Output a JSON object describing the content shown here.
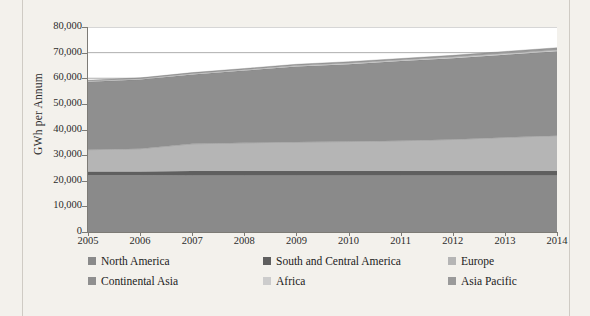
{
  "figure": {
    "background_color": "#f3f1ec",
    "plot_background_color": "#ffffff"
  },
  "chart_data": {
    "type": "area",
    "stacked": true,
    "title": "",
    "xlabel": "",
    "ylabel": "GWh per Annum",
    "x": [
      2005,
      2006,
      2007,
      2008,
      2009,
      2010,
      2011,
      2012,
      2013,
      2014
    ],
    "categories": [
      "2005",
      "2006",
      "2007",
      "2008",
      "2009",
      "2010",
      "2011",
      "2012",
      "2013",
      "2014"
    ],
    "ylim": [
      0,
      80000
    ],
    "yticks": [
      0,
      10000,
      20000,
      30000,
      40000,
      50000,
      60000,
      70000,
      80000
    ],
    "ytick_labels": [
      "0",
      "10,000",
      "20,000",
      "30,000",
      "40,000",
      "50,000",
      "60,000",
      "70,000",
      "80,000"
    ],
    "xlim": [
      2005,
      2014
    ],
    "grid": true,
    "gridlines_visible_at": [
      70000,
      80000
    ],
    "legend_position": "bottom",
    "series": [
      {
        "name": "North America",
        "color": "#8a8a8a",
        "values": [
          22100,
          22100,
          22200,
          22200,
          22200,
          22200,
          22200,
          22200,
          22200,
          22200
        ]
      },
      {
        "name": "South and Central America",
        "color": "#5f5f5f",
        "values": [
          1500,
          1500,
          1600,
          1600,
          1600,
          1600,
          1600,
          1600,
          1600,
          1600
        ]
      },
      {
        "name": "Europe",
        "color": "#b5b5b5",
        "values": [
          8500,
          8900,
          10600,
          11000,
          11300,
          11500,
          11800,
          12300,
          13100,
          13800
        ]
      },
      {
        "name": "Continental Asia",
        "color": "#8f8f8f",
        "values": [
          26500,
          27000,
          27100,
          28200,
          29500,
          30200,
          31100,
          31700,
          32300,
          32900
        ]
      },
      {
        "name": "Africa",
        "color": "#cccccc",
        "values": [
          300,
          300,
          300,
          350,
          350,
          400,
          400,
          450,
          450,
          500
        ]
      },
      {
        "name": "Asia Pacific",
        "color": "#9a9a9a",
        "values": [
          350,
          350,
          400,
          450,
          500,
          550,
          600,
          700,
          800,
          900
        ]
      }
    ],
    "series_totals": [
      59250,
      60150,
      62200,
      63800,
      65450,
      66450,
      67700,
      68950,
      70450,
      71900
    ],
    "legend_entries": [
      {
        "label": "North America",
        "color": "#8a8a8a"
      },
      {
        "label": "South and Central America",
        "color": "#5f5f5f"
      },
      {
        "label": "Europe",
        "color": "#b5b5b5"
      },
      {
        "label": "Continental Asia",
        "color": "#8f8f8f"
      },
      {
        "label": "Africa",
        "color": "#cccccc"
      },
      {
        "label": "Asia Pacific",
        "color": "#9a9a9a"
      }
    ]
  }
}
